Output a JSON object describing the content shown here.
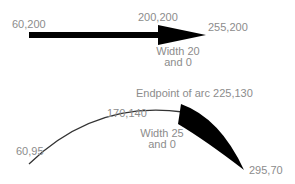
{
  "diagram": {
    "straight_arrow": {
      "start_label": "60,200",
      "mid_label": "200,200",
      "end_label": "255,200",
      "width_label_line1": "Width 20",
      "width_label_line2": "and 0"
    },
    "arc_arrow": {
      "start_label": "60,95",
      "mid_label": "170,140",
      "endpoint_label": "Endpoint of arc 225,130",
      "end_label": "295,70",
      "width_label_line1": "Width 25",
      "width_label_line2": "and 0"
    },
    "colors": {
      "stroke": "#000000",
      "label": "#8c8c8c",
      "background": "#ffffff"
    }
  }
}
